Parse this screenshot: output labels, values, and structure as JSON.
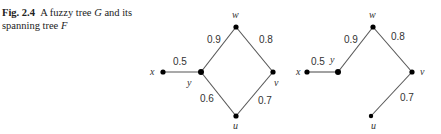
{
  "caption": {
    "fig_label": "Fig. 2.4",
    "text_before_G": "A fuzzy tree ",
    "G": "G",
    "text_between": " and its spanning tree ",
    "F": "F"
  },
  "graphs": [
    {
      "name": "G",
      "nodes": [
        {
          "id": "x",
          "label": "x",
          "cx": 163,
          "cy": 72,
          "r": 2.6,
          "lx": 150,
          "ly": 75
        },
        {
          "id": "y",
          "label": "y",
          "cx": 201,
          "cy": 72,
          "r": 3,
          "lx": 187,
          "ly": 86
        },
        {
          "id": "w",
          "label": "w",
          "cx": 236,
          "cy": 27,
          "r": 2.6,
          "lx": 232,
          "ly": 18
        },
        {
          "id": "v",
          "label": "v",
          "cx": 273,
          "cy": 72,
          "r": 2.6,
          "lx": 274,
          "ly": 86
        },
        {
          "id": "u",
          "label": "u",
          "cx": 236,
          "cy": 116,
          "r": 2.6,
          "lx": 233,
          "ly": 129
        }
      ],
      "edges": [
        {
          "from": "x",
          "to": "y",
          "weight": "0.5",
          "lx": 173,
          "ly": 65
        },
        {
          "from": "y",
          "to": "w",
          "weight": "0.9",
          "lx": 207,
          "ly": 43
        },
        {
          "from": "w",
          "to": "v",
          "weight": "0.8",
          "lx": 259,
          "ly": 43
        },
        {
          "from": "y",
          "to": "u",
          "weight": "0.6",
          "lx": 200,
          "ly": 102
        },
        {
          "from": "u",
          "to": "v",
          "weight": "0.7",
          "lx": 258,
          "ly": 104
        }
      ]
    },
    {
      "name": "F",
      "nodes": [
        {
          "id": "x",
          "label": "x",
          "cx": 307,
          "cy": 72,
          "r": 2.6,
          "lx": 296,
          "ly": 75
        },
        {
          "id": "y",
          "label": "y",
          "cx": 338,
          "cy": 72,
          "r": 3,
          "lx": 330,
          "ly": 63
        },
        {
          "id": "w",
          "label": "w",
          "cx": 373,
          "cy": 27,
          "r": 2.6,
          "lx": 369,
          "ly": 18
        },
        {
          "id": "v",
          "label": "v",
          "cx": 412,
          "cy": 72,
          "r": 2.6,
          "lx": 420,
          "ly": 75
        },
        {
          "id": "u",
          "label": "u",
          "cx": 371,
          "cy": 116,
          "r": 2.2,
          "lx": 371,
          "ly": 129
        }
      ],
      "edges": [
        {
          "from": "x",
          "to": "y",
          "weight": "0.5",
          "lx": 311,
          "ly": 65
        },
        {
          "from": "y",
          "to": "w",
          "weight": "0.9",
          "lx": 344,
          "ly": 43
        },
        {
          "from": "w",
          "to": "v",
          "weight": "0.8",
          "lx": 391,
          "ly": 40
        },
        {
          "from": "v",
          "to": "u",
          "weight": "0.7",
          "lx": 400,
          "ly": 101
        }
      ]
    }
  ]
}
